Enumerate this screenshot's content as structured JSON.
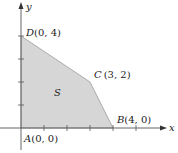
{
  "diagram": {
    "type": "feasible-region",
    "axes": {
      "x_label": "x",
      "y_label": "y"
    },
    "region_label": "S",
    "vertices": [
      {
        "name": "A",
        "coords": "(0, 0)",
        "x": 0,
        "y": 0
      },
      {
        "name": "B",
        "coords": "(4, 0)",
        "x": 4,
        "y": 0
      },
      {
        "name": "C",
        "coords": "(3, 2)",
        "x": 3,
        "y": 2
      },
      {
        "name": "D",
        "coords": "(0, 4)",
        "x": 0,
        "y": 4
      }
    ],
    "x_ticks": [
      1,
      2,
      3,
      4,
      5
    ],
    "y_ticks": [
      1,
      2,
      3,
      4
    ],
    "colors": {
      "fill": "#d6d6d6",
      "axis": "#555555",
      "edge": "#9a9a9a"
    }
  }
}
